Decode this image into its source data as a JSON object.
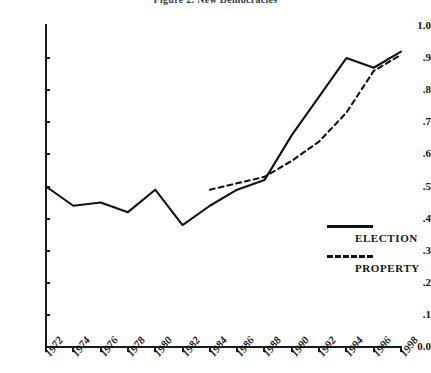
{
  "chart_data": {
    "type": "line",
    "title": "Figure 2. New Democracies",
    "xlabel": "",
    "ylabel": "",
    "ylim": [
      0.0,
      1.0
    ],
    "grid": false,
    "legend_position": "right",
    "y_ticks": [
      "1.0",
      ".9",
      ".8",
      ".7",
      ".6",
      ".5",
      ".4",
      ".3",
      ".2",
      ".1",
      "0.0"
    ],
    "y_tick_values": [
      1.0,
      0.9,
      0.8,
      0.7,
      0.6,
      0.5,
      0.4,
      0.3,
      0.2,
      0.1,
      0.0
    ],
    "categories": [
      "1972",
      "1974",
      "1976",
      "1978",
      "1980",
      "1982",
      "1984",
      "1986",
      "1988",
      "1990",
      "1992",
      "1994",
      "1996",
      "1998"
    ],
    "x_tick_labels": [
      "1972",
      "1974",
      "1976",
      "1978",
      "1980",
      "1982",
      "1984",
      "1986",
      "1988",
      "1990",
      "1992",
      "1994",
      "1996",
      "1998"
    ],
    "series": [
      {
        "name": "ELECTION",
        "style": "solid",
        "values": [
          0.5,
          0.44,
          0.45,
          0.42,
          0.49,
          0.38,
          0.44,
          0.49,
          0.52,
          0.66,
          0.78,
          0.9,
          0.87,
          0.92
        ]
      },
      {
        "name": "PROPERTY",
        "style": "dashed",
        "values": [
          null,
          null,
          null,
          null,
          null,
          null,
          0.49,
          0.51,
          0.53,
          0.58,
          0.64,
          0.73,
          0.86,
          0.91
        ]
      }
    ]
  },
  "legend": {
    "entries": [
      {
        "label": "ELECTION",
        "style": "solid"
      },
      {
        "label": "PROPERTY",
        "style": "dashed"
      }
    ]
  }
}
